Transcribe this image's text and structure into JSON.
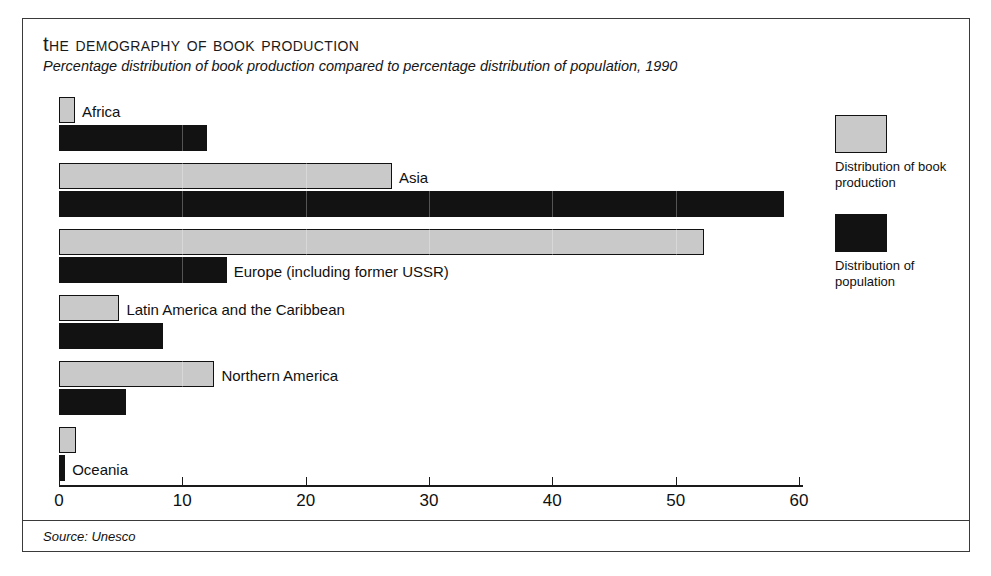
{
  "chart_data": {
    "type": "bar",
    "orientation": "horizontal",
    "title": "The Demography of Book Production",
    "subtitle": "Percentage distribution of book production compared to percentage distribution of population, 1990",
    "xlabel": "",
    "ylabel": "",
    "xlim": [
      0,
      60
    ],
    "xticks": [
      0,
      10,
      20,
      30,
      40,
      50,
      60
    ],
    "xtick_labels": [
      "0",
      "10",
      "20",
      "30",
      "40",
      "50",
      "60"
    ],
    "grid": false,
    "legend_position": "right",
    "categories": [
      "Africa",
      "Asia",
      "Europe (including former USSR)",
      "Latin America and the Caribbean",
      "Northern America",
      "Oceania"
    ],
    "series": [
      {
        "name": "Distribution of book production",
        "color": "#c9c9c9",
        "values": [
          1.3,
          27.0,
          52.3,
          4.9,
          12.6,
          1.4
        ]
      },
      {
        "name": "Distribution of population",
        "color": "#121212",
        "values": [
          12.0,
          58.8,
          13.6,
          8.4,
          5.4,
          0.5
        ]
      }
    ],
    "source": "Source: Unesco"
  },
  "legend": {
    "items": [
      {
        "label": "Distribution of book production",
        "swatch": "book"
      },
      {
        "label": "Distribution of population",
        "swatch": "pop"
      }
    ]
  }
}
